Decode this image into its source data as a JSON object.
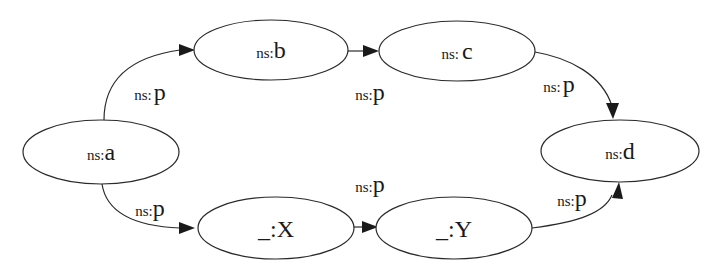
{
  "diagram": {
    "type": "rdf-graph",
    "nodes": {
      "a": {
        "prefix": "ns:",
        "local": "a"
      },
      "b": {
        "prefix": "ns:",
        "local": "b"
      },
      "c": {
        "prefix": "ns:",
        "local": "c"
      },
      "d": {
        "prefix": "ns:",
        "local": "d"
      },
      "x": {
        "prefix": "_:",
        "local": "X"
      },
      "y": {
        "prefix": "_:",
        "local": "Y"
      }
    },
    "edges": {
      "a_b": {
        "from": "ns:a",
        "to": "ns:b",
        "prefix": "ns:",
        "local": "p"
      },
      "b_c": {
        "from": "ns:b",
        "to": "ns:c",
        "prefix": "ns:",
        "local": "p"
      },
      "c_d": {
        "from": "ns:c",
        "to": "ns:d",
        "prefix": "ns:",
        "local": "p"
      },
      "a_x": {
        "from": "ns:a",
        "to": "_:X",
        "prefix": "ns:",
        "local": "p"
      },
      "x_y": {
        "from": "_:X",
        "to": "_:Y",
        "prefix": "ns:",
        "local": "p"
      },
      "y_d": {
        "from": "_:Y",
        "to": "ns:d",
        "prefix": "ns:",
        "local": "p"
      }
    }
  }
}
